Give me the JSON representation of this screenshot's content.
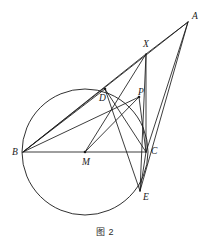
{
  "figure": {
    "caption": "图 2",
    "width": 210,
    "height": 244,
    "background_color": "#ffffff",
    "stroke_color": "#1a1a1a",
    "label_color": "#1a1a1a"
  },
  "circle": {
    "name": "circumcircle",
    "center_label": "M",
    "cx": 85,
    "cy": 152,
    "r": 63
  },
  "points": [
    {
      "id": "A",
      "label": "A",
      "x": 188,
      "y": 22,
      "label_x": 192,
      "label_y": 19
    },
    {
      "id": "X",
      "label": "X",
      "x": 146,
      "y": 54,
      "label_x": 143,
      "label_y": 47
    },
    {
      "id": "D",
      "label": "D",
      "x": 105,
      "y": 89,
      "label_x": 99,
      "label_y": 101
    },
    {
      "id": "P",
      "label": "P",
      "x": 139,
      "y": 97,
      "label_x": 138,
      "label_y": 95
    },
    {
      "id": "B",
      "label": "B",
      "x": 23,
      "y": 152,
      "label_x": 12,
      "label_y": 155
    },
    {
      "id": "M",
      "label": "M",
      "x": 85,
      "y": 152,
      "label_x": 82,
      "label_y": 165
    },
    {
      "id": "C",
      "label": "C",
      "x": 146,
      "y": 152,
      "label_x": 151,
      "label_y": 154
    },
    {
      "id": "E",
      "label": "E",
      "x": 140,
      "y": 191,
      "label_x": 143,
      "label_y": 200
    }
  ],
  "segments": [
    {
      "name": "segment-B-C",
      "from": "B",
      "to": "C"
    },
    {
      "name": "segment-A-B",
      "from": "A",
      "to": "B"
    },
    {
      "name": "segment-A-X",
      "from": "A",
      "to": "X"
    },
    {
      "name": "segment-A-C",
      "from": "A",
      "to": "C"
    },
    {
      "name": "segment-A-E",
      "from": "A",
      "to": "E"
    },
    {
      "name": "segment-X-C",
      "from": "X",
      "to": "C"
    },
    {
      "name": "segment-X-B",
      "from": "X",
      "to": "B"
    },
    {
      "name": "segment-X-M",
      "from": "X",
      "to": "M"
    },
    {
      "name": "segment-X-E",
      "from": "X",
      "to": "E"
    },
    {
      "name": "segment-B-D",
      "from": "B",
      "to": "D"
    },
    {
      "name": "segment-B-P",
      "from": "B",
      "to": "P"
    },
    {
      "name": "segment-D-C",
      "from": "D",
      "to": "C"
    },
    {
      "name": "segment-D-E",
      "from": "D",
      "to": "E"
    },
    {
      "name": "segment-M-P",
      "from": "M",
      "to": "P"
    },
    {
      "name": "segment-P-C",
      "from": "P",
      "to": "C"
    },
    {
      "name": "segment-C-E",
      "from": "C",
      "to": "E"
    }
  ],
  "vertex_dots": [
    "D",
    "M",
    "P"
  ]
}
